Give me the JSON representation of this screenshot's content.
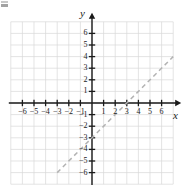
{
  "figure": {
    "type": "coordinate-plane-graph",
    "background_color": "#ffffff",
    "grid_color": "#d9d9d9",
    "axis_color": "#1a1a1a",
    "line_color": "#b3b3b3",
    "corner_artifact": true
  },
  "axes": {
    "x_label": "x",
    "y_label": "y",
    "x_min": -7,
    "x_max": 7,
    "y_min": -7,
    "y_max": 7,
    "x_tick_labels": [
      "-6",
      "-5",
      "-4",
      "-3",
      "-2",
      "-1",
      "1",
      "2",
      "3",
      "4",
      "5",
      "6"
    ],
    "y_tick_labels": [
      "6",
      "5",
      "4",
      "3",
      "2",
      "1",
      "-1",
      "-2",
      "-3",
      "-4",
      "-5",
      "-6"
    ],
    "arrowheads": [
      "x-positive",
      "y-positive"
    ]
  },
  "chart_data": {
    "type": "line",
    "title": "",
    "xlabel": "x",
    "ylabel": "y",
    "xlim": [
      -7,
      7
    ],
    "ylim": [
      -7,
      7
    ],
    "grid": true,
    "legend": "none",
    "series": [
      {
        "name": "y = x - 3",
        "style": "dashed",
        "color": "#b3b3b3",
        "slope": 1,
        "y_intercept": -3,
        "x_intercept": 3,
        "x": [
          -3,
          7
        ],
        "values": [
          -6,
          4
        ],
        "points": [
          {
            "x": -3,
            "y": -6
          },
          {
            "x": 0,
            "y": -3
          },
          {
            "x": 3,
            "y": 0
          },
          {
            "x": 7,
            "y": 4
          }
        ]
      }
    ]
  }
}
